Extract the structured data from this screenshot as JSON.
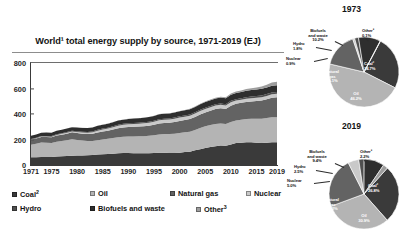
{
  "chart_data": [
    {
      "type": "area",
      "id": "world-total-energy-supply",
      "title": "World¹ total energy supply by source, 1971-2019 (EJ)",
      "xlabel": "",
      "ylabel": "",
      "ylim": [
        0,
        800
      ],
      "yticks": [
        0,
        200,
        400,
        600,
        800
      ],
      "xticks": [
        "1971",
        "1975",
        "1980",
        "1985",
        "1990",
        "1995",
        "2000",
        "2005",
        "2010",
        "2015",
        "2019"
      ],
      "x": [
        1971,
        1972,
        1973,
        1974,
        1975,
        1976,
        1977,
        1978,
        1979,
        1980,
        1981,
        1982,
        1983,
        1984,
        1985,
        1986,
        1987,
        1988,
        1989,
        1990,
        1991,
        1992,
        1993,
        1994,
        1995,
        1996,
        1997,
        1998,
        1999,
        2000,
        2001,
        2002,
        2003,
        2004,
        2005,
        2006,
        2007,
        2008,
        2009,
        2010,
        2011,
        2012,
        2013,
        2014,
        2015,
        2016,
        2017,
        2018,
        2019
      ],
      "stacked": true,
      "grid": false,
      "legend_position": "bottom",
      "series": [
        {
          "name": "Coal²",
          "color": "#3a3a3a",
          "values": [
            60,
            61,
            63,
            63,
            63,
            66,
            68,
            70,
            73,
            74,
            75,
            76,
            78,
            82,
            85,
            86,
            89,
            92,
            94,
            94,
            93,
            92,
            93,
            93,
            94,
            96,
            96,
            95,
            94,
            97,
            101,
            104,
            115,
            124,
            133,
            141,
            148,
            152,
            151,
            161,
            172,
            175,
            178,
            179,
            175,
            172,
            174,
            178,
            178
          ]
        },
        {
          "name": "Oil",
          "color": "#b4b4b4",
          "values": [
            98,
            105,
            113,
            112,
            110,
            117,
            121,
            125,
            129,
            123,
            117,
            113,
            111,
            113,
            115,
            119,
            122,
            126,
            128,
            130,
            131,
            133,
            133,
            136,
            139,
            143,
            147,
            148,
            152,
            154,
            155,
            157,
            160,
            167,
            170,
            172,
            174,
            173,
            171,
            177,
            178,
            180,
            182,
            184,
            188,
            191,
            194,
            196,
            196
          ]
        },
        {
          "name": "Natural gas",
          "color": "#636363",
          "values": [
            40,
            42,
            44,
            45,
            45,
            48,
            49,
            51,
            54,
            54,
            54,
            54,
            56,
            60,
            62,
            63,
            67,
            70,
            73,
            75,
            76,
            76,
            78,
            79,
            82,
            87,
            87,
            88,
            91,
            95,
            96,
            99,
            102,
            106,
            109,
            112,
            117,
            120,
            118,
            127,
            130,
            133,
            135,
            136,
            139,
            143,
            148,
            154,
            158
          ]
        },
        {
          "name": "Nuclear",
          "color": "#c9c9c9",
          "values": [
            1.7,
            2.2,
            2.6,
            3.3,
            4.4,
            5.1,
            6.2,
            7.1,
            7.2,
            8.0,
            9.7,
            10.4,
            11.8,
            14.4,
            16.4,
            17.4,
            18.6,
            20.0,
            20.5,
            21.2,
            22.1,
            22.3,
            23.1,
            23.4,
            24.2,
            25.2,
            24.9,
            25.3,
            26.3,
            26.6,
            27.0,
            27.1,
            26.7,
            27.5,
            27.7,
            27.8,
            27.1,
            27.2,
            26.4,
            27.0,
            25.1,
            24.0,
            24.2,
            24.6,
            25.0,
            25.5,
            25.9,
            26.1,
            26.4
          ]
        },
        {
          "name": "Hydro",
          "color": "#4f4f4f",
          "values": [
            4.4,
            4.5,
            4.6,
            5.0,
            5.1,
            5.1,
            5.3,
            5.6,
            5.8,
            6.0,
            6.0,
            6.2,
            6.6,
            6.8,
            6.9,
            7.0,
            7.0,
            7.2,
            7.2,
            7.5,
            7.7,
            7.6,
            8.0,
            8.1,
            8.4,
            8.6,
            8.6,
            8.8,
            9.0,
            9.3,
            9.2,
            9.3,
            9.3,
            9.6,
            9.9,
            10.2,
            10.3,
            10.7,
            11.0,
            11.5,
            11.5,
            12.2,
            12.8,
            13.0,
            13.2,
            13.8,
            14.1,
            14.5,
            14.8
          ]
        },
        {
          "name": "Biofuels and waste",
          "color": "#2e2e2e",
          "values": [
            25,
            25,
            25,
            26,
            26,
            27,
            27,
            28,
            28,
            29,
            29,
            30,
            30,
            31,
            31,
            32,
            32,
            33,
            33,
            34,
            34,
            35,
            36,
            36,
            37,
            38,
            38,
            39,
            39,
            40,
            41,
            41,
            42,
            43,
            44,
            45,
            45,
            46,
            47,
            48,
            49,
            49,
            50,
            51,
            51,
            52,
            52,
            53,
            53
          ]
        },
        {
          "name": "Other³",
          "color": "#9d9d9d",
          "values": [
            0.2,
            0.2,
            0.2,
            0.3,
            0.3,
            0.3,
            0.3,
            0.4,
            0.4,
            0.4,
            0.5,
            0.5,
            0.5,
            0.6,
            0.7,
            0.7,
            0.8,
            0.8,
            0.9,
            1.0,
            1.1,
            1.2,
            1.3,
            1.4,
            1.5,
            1.7,
            1.9,
            2.1,
            2.3,
            2.6,
            2.9,
            3.2,
            3.6,
            4.0,
            4.6,
            5.3,
            6.1,
            7.0,
            7.9,
            9.0,
            10.4,
            11.8,
            13.3,
            15.2,
            17.1,
            19.2,
            21.8,
            24.6,
            27.5
          ]
        }
      ]
    },
    {
      "type": "pie",
      "id": "shares-1973",
      "title": "1973",
      "labels": [
        "Coal²",
        "Oil",
        "Natural gas",
        "Nuclear",
        "Hydro",
        "Biofuels and waste",
        "Other³"
      ],
      "values": [
        24.7,
        46.2,
        16.1,
        0.9,
        1.8,
        10.2,
        0.1
      ],
      "value_labels": [
        "24.7%",
        "46.2%",
        "16.1%",
        "0.9%",
        "1.8%",
        "10.2%",
        "0.1%"
      ],
      "colors": [
        "#3a3a3a",
        "#b4b4b4",
        "#636363",
        "#c9c9c9",
        "#4f4f4f",
        "#2e2e2e",
        "#9d9d9d"
      ]
    },
    {
      "type": "pie",
      "id": "shares-2019",
      "title": "2019",
      "labels": [
        "Coal²",
        "Oil",
        "Natural gas",
        "Nuclear",
        "Hydro",
        "Biofuels and waste",
        "Other³"
      ],
      "values": [
        26.8,
        30.9,
        23.2,
        5.0,
        2.5,
        9.4,
        2.2
      ],
      "value_labels": [
        "26.8%",
        "30.9%",
        "23.2%",
        "5.0%",
        "2.5%",
        "9.4%",
        "2.2%"
      ],
      "colors": [
        "#3a3a3a",
        "#b4b4b4",
        "#636363",
        "#c9c9c9",
        "#4f4f4f",
        "#2e2e2e",
        "#9d9d9d"
      ]
    }
  ],
  "chart": {
    "title": "World¹ total energy supply by source, 1971-2019 (EJ)"
  },
  "legend": {
    "items": [
      {
        "label": "Coal",
        "sup": "2",
        "color": "#3a3a3a"
      },
      {
        "label": "Oil",
        "sup": "",
        "color": "#b4b4b4"
      },
      {
        "label": "Natural gas",
        "sup": "",
        "color": "#636363"
      },
      {
        "label": "Nuclear",
        "sup": "",
        "color": "#c9c9c9"
      },
      {
        "label": "Hydro",
        "sup": "",
        "color": "#4f4f4f"
      },
      {
        "label": "Biofuels and waste",
        "sup": "",
        "color": "#2e2e2e"
      },
      {
        "label": "Other",
        "sup": "3",
        "color": "#9d9d9d"
      }
    ]
  },
  "pies": {
    "first_year": "1973",
    "second_year": "2019"
  }
}
